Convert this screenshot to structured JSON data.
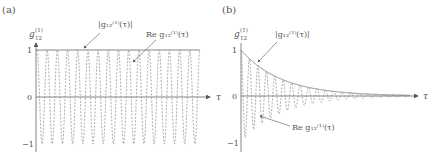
{
  "figure": {
    "panels": [
      {
        "label": "(a)",
        "ylabel_main": "g",
        "ylabel_sub": "12",
        "ylabel_sup": "(1)",
        "xlabel": "τ",
        "ticks": [
          "1",
          "0",
          "−1"
        ],
        "annotations": {
          "envelope": "|g₁₂⁽¹⁾(τ)|",
          "real": "Re g₁₂⁽¹⁾(τ)"
        }
      },
      {
        "label": "(b)",
        "ylabel_main": "g",
        "ylabel_sub": "12",
        "ylabel_sup": "(1)",
        "xlabel": "τ",
        "ticks": [
          "1",
          "0",
          "−1"
        ],
        "annotations": {
          "envelope": "|g₁₂⁽¹⁾(τ)|",
          "real": "Re g₁₂⁽¹⁾(τ)"
        }
      }
    ],
    "colors": {
      "axis": "#666666",
      "envelope": "#777777",
      "real": "#888888"
    }
  },
  "chart_data": [
    {
      "type": "line",
      "title": "(a)",
      "xlabel": "τ",
      "ylabel": "g12(1)",
      "ylim": [
        -1,
        1
      ],
      "yticks": [
        1,
        0,
        -1
      ],
      "legend_position": "annotations with arrows, top",
      "series": [
        {
          "name": "|g12(1)(τ)|",
          "style": "solid",
          "description": "constant 1",
          "values": [
            1,
            1,
            1,
            1,
            1,
            1,
            1,
            1,
            1,
            1,
            1
          ]
        },
        {
          "name": "Re g12(1)(τ)",
          "style": "dashed",
          "description": "cos oscillation, amplitude 1, ~16 periods",
          "amplitude": 1,
          "periods": 16
        }
      ]
    },
    {
      "type": "line",
      "title": "(b)",
      "xlabel": "τ",
      "ylabel": "g12(1)",
      "ylim": [
        -1,
        1
      ],
      "yticks": [
        1,
        0,
        -1
      ],
      "legend_position": "annotations with arrows",
      "series": [
        {
          "name": "|g12(1)(τ)|",
          "style": "solid",
          "description": "exponential decay from 1 to ~0",
          "values": [
            1.0,
            0.55,
            0.3,
            0.17,
            0.09,
            0.05,
            0.03,
            0.015,
            0.01,
            0.005,
            0.0
          ]
        },
        {
          "name": "Re g12(1)(τ)",
          "style": "dashed",
          "description": "damped cos oscillation within envelope",
          "amplitude": 1,
          "periods": 20
        }
      ]
    }
  ]
}
